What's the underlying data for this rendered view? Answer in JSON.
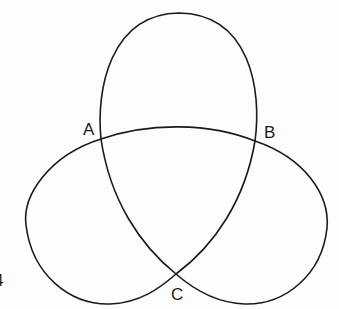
{
  "diagram": {
    "type": "trefoil curve with three self-intersection points",
    "labels": {
      "A": "A",
      "B": "B",
      "C": "C"
    },
    "edge_fragment": "4",
    "stroke_color": "#1a1a1a",
    "background": "#fdfdfd"
  }
}
